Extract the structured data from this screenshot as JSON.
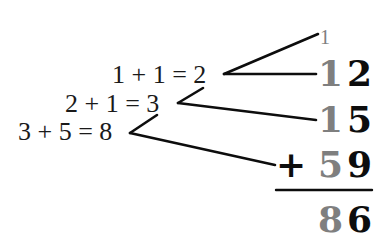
{
  "colors": {
    "carry": "#7f7f7f",
    "digit": "#0d0d0d",
    "text": "#1a1a1a",
    "background": "#ffffff"
  },
  "equations": [
    {
      "text": "1 + 1 = 2"
    },
    {
      "text": "2 + 1 = 3"
    },
    {
      "text": "3 + 5 = 8"
    }
  ],
  "addition": {
    "top_carry": "1",
    "rows": [
      {
        "carry_digit": "1",
        "digit": "2"
      },
      {
        "carry_digit": "1",
        "digit": "5"
      },
      {
        "operator": "+",
        "carry_digit": "5",
        "digit": "9"
      }
    ],
    "result": {
      "tens": "8",
      "ones": "6"
    }
  }
}
